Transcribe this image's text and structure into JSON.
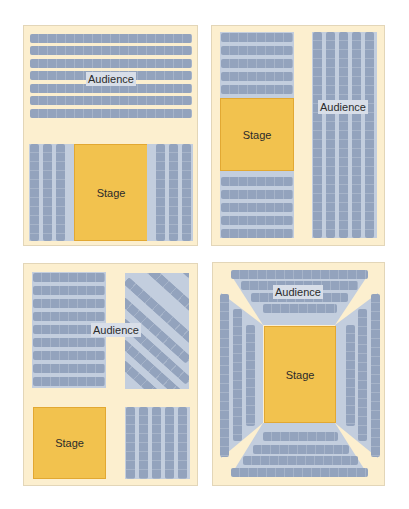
{
  "colors": {
    "panel_bg": "#fcefcf",
    "seat": "#93a3bd",
    "seat_area_bg": "#c3cede",
    "stage": "#f2c24e",
    "label_bg": "#d8dee8"
  },
  "layouts": [
    {
      "id": "layout-1",
      "audience_label": "Audience",
      "stage_label": "Stage",
      "description": "Horizontal rows above, stage at bottom center flanked by vertical columns",
      "top_rows": 7,
      "left_columns": 3,
      "right_columns": 3
    },
    {
      "id": "layout-2",
      "audience_label": "Audience",
      "stage_label": "Stage",
      "description": "Stage at left between horizontal rows, vertical columns at right",
      "rows_above_stage": 5,
      "rows_below_stage": 5,
      "right_columns": 5
    },
    {
      "id": "layout-3",
      "audience_label": "Audience",
      "stage_label": "Stage",
      "description": "Horizontal rows top-left, diagonal rows top-right, stage bottom-left, vertical columns bottom-right",
      "left_rows": 9,
      "diagonal_rows": 7,
      "bottom_right_columns": 5
    },
    {
      "id": "layout-4",
      "audience_label": "Audience",
      "stage_label": "Stage",
      "description": "Central stage surrounded on four sides by tiered seating",
      "top_rows": 4,
      "bottom_rows": 4,
      "left_columns": 3,
      "right_columns": 3
    }
  ]
}
